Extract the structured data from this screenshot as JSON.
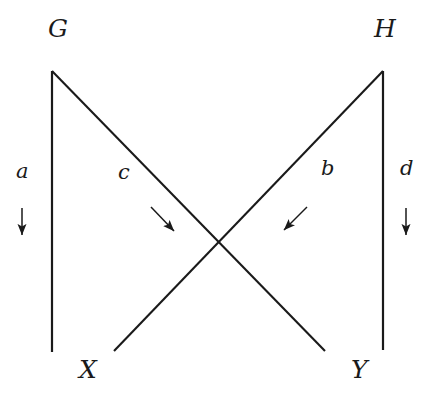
{
  "diagram": {
    "type": "commutative-square-crossed",
    "background_color": "#ffffff",
    "line_color": "#1a1a1a",
    "text_color": "#1a1a1a",
    "nodes": [
      {
        "id": "G",
        "label": "G",
        "x": 48,
        "y": 28,
        "position": "top-left"
      },
      {
        "id": "H",
        "label": "H",
        "x": 374,
        "y": 28,
        "position": "top-right"
      },
      {
        "id": "X",
        "label": "X",
        "x": 79,
        "y": 369,
        "position": "bottom-left"
      },
      {
        "id": "Y",
        "label": "Y",
        "x": 351,
        "y": 369,
        "position": "bottom-right"
      }
    ],
    "edges": [
      {
        "id": "a",
        "label": "a",
        "from": "G",
        "to": "X",
        "label_x": 22,
        "label_y": 170,
        "line": {
          "x1": 52,
          "y1": 71,
          "x2": 52,
          "y2": 352
        },
        "marker": {
          "type": "arrow-down",
          "x1": 22,
          "y1": 208,
          "x2": 22,
          "y2": 236
        }
      },
      {
        "id": "c",
        "label": "c",
        "from": "G",
        "to": "Y",
        "label_x": 123,
        "label_y": 171,
        "line": {
          "x1": 52,
          "y1": 71,
          "x2": 325,
          "y2": 351
        },
        "marker": {
          "type": "arrow-down-right",
          "x1": 151,
          "y1": 207,
          "x2": 175,
          "y2": 232
        }
      },
      {
        "id": "b",
        "label": "b",
        "from": "H",
        "to": "X",
        "label_x": 324,
        "label_y": 168,
        "line": {
          "x1": 383,
          "y1": 71,
          "x2": 114,
          "y2": 351
        },
        "marker": {
          "type": "arrow-down-left",
          "x1": 307,
          "y1": 207,
          "x2": 283,
          "y2": 231
        }
      },
      {
        "id": "d",
        "label": "d",
        "from": "H",
        "to": "Y",
        "label_x": 401,
        "label_y": 168,
        "line": {
          "x1": 383,
          "y1": 71,
          "x2": 383,
          "y2": 350
        },
        "marker": {
          "type": "arrow-down",
          "x1": 406,
          "y1": 208,
          "x2": 406,
          "y2": 236
        }
      }
    ]
  }
}
